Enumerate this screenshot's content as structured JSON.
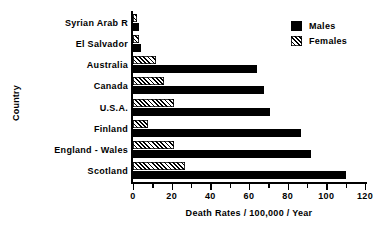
{
  "chart_data": {
    "type": "bar",
    "orientation": "horizontal",
    "title": "",
    "xlabel": "Death Rates / 100,000 / Year",
    "ylabel": "Country",
    "categories": [
      "Syrian Arab R",
      "El Salvador",
      "Australia",
      "Canada",
      "U.S.A.",
      "Finland",
      "England - Wales",
      "Scotland"
    ],
    "series": [
      {
        "name": "Males",
        "style": "solid-black",
        "color": "#000000",
        "values": [
          3,
          4,
          64,
          68,
          71,
          87,
          92,
          110
        ]
      },
      {
        "name": "Females",
        "style": "diagonal-hatch",
        "color": "#000000",
        "values": [
          2,
          3,
          12,
          16,
          21,
          8,
          21,
          27
        ]
      }
    ],
    "xlim": [
      0,
      120
    ],
    "xticks": [
      0,
      20,
      40,
      60,
      80,
      100,
      120
    ],
    "xtick_labels": [
      "0",
      "20",
      "40",
      "60",
      "80",
      "100",
      "120"
    ],
    "xminor_ticks": [
      10,
      30,
      50,
      70,
      90,
      110
    ],
    "grid": false,
    "legend_position": "top-right",
    "legend_entries": [
      "Males",
      "Females"
    ]
  },
  "legend": {
    "males_label": "Males",
    "females_label": "Females"
  },
  "axes": {
    "x_title": "Death Rates / 100,000 / Year",
    "y_title": "Country"
  }
}
